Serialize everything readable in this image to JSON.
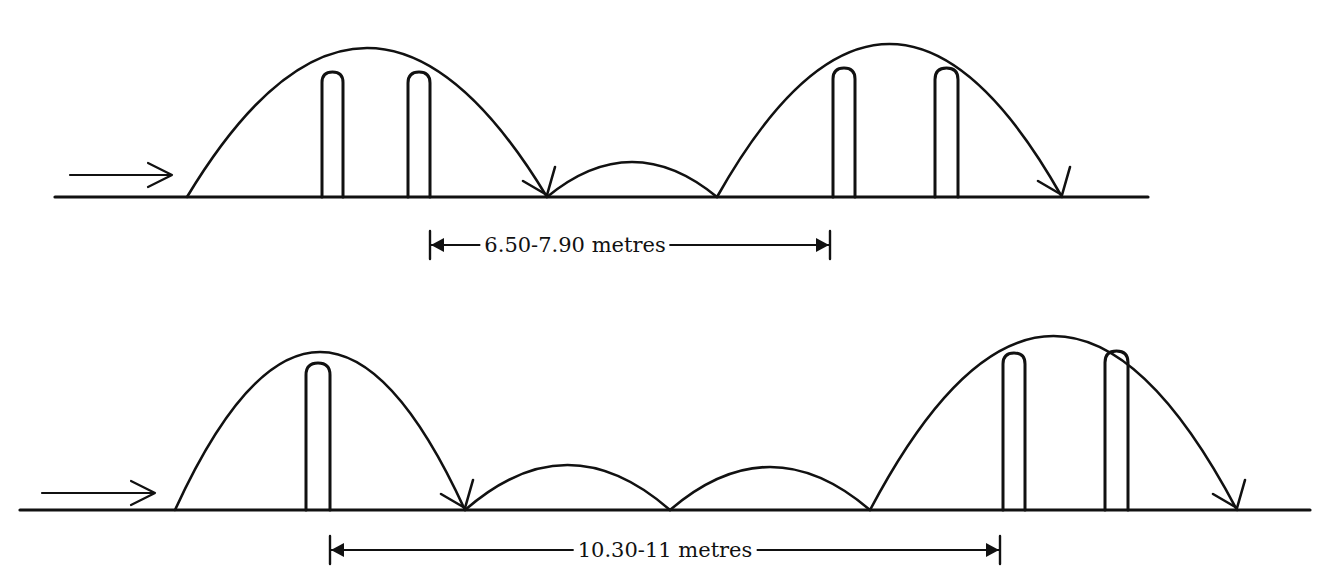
{
  "diagrams": [
    {
      "name": "two-bounce-interval",
      "ground": {
        "x1": 55,
        "x2": 1148,
        "y": 197
      },
      "approach_arrow": {
        "x1": 70,
        "x2": 172,
        "y": 175
      },
      "arcs": [
        {
          "x1": 187,
          "x2": 547,
          "peak_y": 48,
          "arrowhead": true
        },
        {
          "x1": 547,
          "x2": 717,
          "peak_y": 162,
          "arrowhead": false
        },
        {
          "x1": 717,
          "x2": 1062,
          "peak_y": 44,
          "arrowhead": true
        }
      ],
      "posts": [
        {
          "x": 322,
          "w": 21,
          "top": 72
        },
        {
          "x": 408,
          "w": 22,
          "top": 72
        },
        {
          "x": 833,
          "w": 22,
          "top": 68
        },
        {
          "x": 935,
          "w": 23,
          "top": 68
        }
      ],
      "dimension": {
        "x1": 430,
        "x2": 830,
        "y": 245,
        "label": "6.50-7.90 metres"
      }
    },
    {
      "name": "three-bounce-interval",
      "ground": {
        "x1": 20,
        "x2": 1310,
        "y": 510
      },
      "approach_arrow": {
        "x1": 42,
        "x2": 155,
        "y": 493
      },
      "arcs": [
        {
          "x1": 175,
          "x2": 465,
          "peak_y": 352,
          "arrowhead": true
        },
        {
          "x1": 465,
          "x2": 670,
          "peak_y": 465,
          "arrowhead": false
        },
        {
          "x1": 670,
          "x2": 870,
          "peak_y": 467,
          "arrowhead": false
        },
        {
          "x1": 870,
          "x2": 1237,
          "peak_y": 336,
          "arrowhead": true
        }
      ],
      "posts": [
        {
          "x": 306,
          "w": 24,
          "top": 363
        },
        {
          "x": 1003,
          "w": 22,
          "top": 353
        },
        {
          "x": 1105,
          "w": 23,
          "top": 351
        }
      ],
      "dimension": {
        "x1": 330,
        "x2": 1000,
        "y": 550,
        "label": "10.30-11 metres"
      }
    }
  ],
  "labels": {
    "top_dimension": "6.50-7.90 metres",
    "bottom_dimension": "10.30-11 metres"
  },
  "colors": {
    "ink": "#111111",
    "background": "#ffffff"
  }
}
